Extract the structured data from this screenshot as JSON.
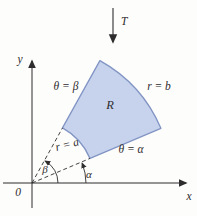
{
  "figure": {
    "applied_force_label": "T",
    "y_axis_label": "y",
    "x_axis_label": "x",
    "origin_label": "0",
    "region_label": "R",
    "outer_radius_label": "r = b",
    "inner_radius_label": "r = a",
    "upper_angle_boundary_label": "θ = β",
    "lower_angle_boundary_label": "θ = α",
    "beta_angle_label": "β",
    "alpha_angle_label": "α"
  },
  "colors": {
    "region_fill": "#c7d3ed",
    "region_stroke": "#8194c4",
    "line": "#2e2c2d",
    "text": "#2e2c2d",
    "background": "#fdfdfc"
  }
}
